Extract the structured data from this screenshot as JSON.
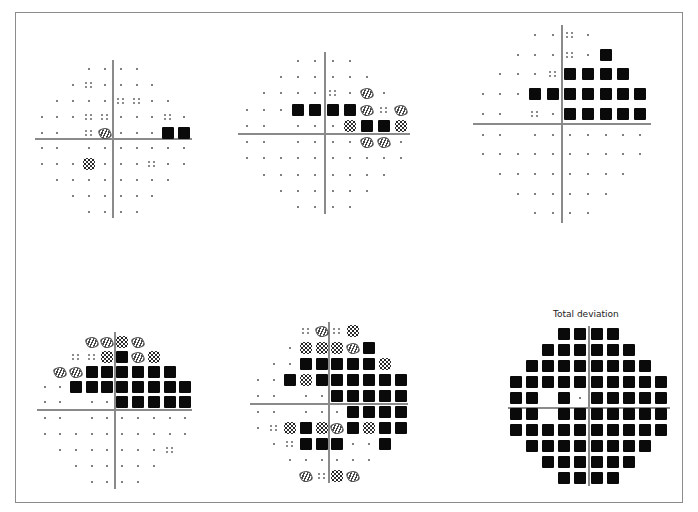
{
  "figure": {
    "legend_symbols": {
      ".": "normal point",
      ":": "p<5%",
      "/": "p<2%",
      "#": "p<1%",
      "B": "p<0.5%"
    }
  },
  "plots": [
    {
      "id": "plot-1",
      "title": "",
      "cols_x": [
        42,
        57,
        73,
        89,
        105,
        121,
        137,
        152,
        168,
        184
      ],
      "rows_y": [
        69,
        85,
        101,
        117,
        133,
        148,
        164,
        180,
        196,
        212
      ],
      "axis": {
        "x": 113,
        "y": 139,
        "h_from": 35,
        "h_to": 192,
        "v_from": 60,
        "v_to": 218
      },
      "rows": [
        "   ....   ",
        "  .:....  ",
        " ....::.. ",
        "...::...:.",
        ".. :/...BB",
        ".. .......",
        "...#...:..",
        " ........ ",
        "  ......  ",
        "   ....   "
      ]
    },
    {
      "id": "plot-2",
      "title": "",
      "cols_x": [
        247,
        264,
        281,
        298,
        315,
        333,
        350,
        367,
        384,
        401
      ],
      "rows_y": [
        61,
        77,
        93,
        110,
        126,
        142,
        158,
        175,
        191,
        207
      ],
      "axis": {
        "x": 325,
        "y": 134,
        "h_from": 238,
        "h_to": 410,
        "v_from": 52,
        "v_to": 214
      },
      "rows": [
        "   ....   ",
        "  ......  ",
        " ....:./. ",
        "...BBBB/:/",
        ".. ...#BB#",
        ".. ....//.",
        "..........",
        " ........ ",
        "  ......  ",
        "   ....   "
      ]
    },
    {
      "id": "plot-3",
      "title": "",
      "cols_x": [
        483,
        500,
        518,
        535,
        553,
        570,
        588,
        606,
        623,
        640
      ],
      "rows_y": [
        35,
        55,
        74,
        94,
        114,
        135,
        154,
        174,
        194,
        213
      ],
      "axis": {
        "x": 562,
        "y": 124,
        "h_from": 473,
        "h_to": 651,
        "v_from": 25,
        "v_to": 223
      },
      "rows": [
        "   ..:.   ",
        "  ...:.B  ",
        " ...:BBBB ",
        "...BBBBBBB",
        ".. :.BBBBB",
        ".. .......",
        "..........",
        " ........ ",
        "  ......  ",
        "   ....   "
      ]
    },
    {
      "id": "plot-4",
      "title": "",
      "cols_x": [
        45,
        60,
        76,
        92,
        107,
        122,
        138,
        154,
        170,
        185
      ],
      "rows_y": [
        342,
        357,
        372,
        387,
        402,
        418,
        434,
        450,
        466,
        482
      ],
      "axis": {
        "x": 115,
        "y": 410,
        "h_from": 37,
        "h_to": 192,
        "v_from": 332,
        "v_to": 489
      },
      "rows": [
        "   //#/   ",
        "  ::#B/#  ",
        " //BBBBBB ",
        "..BBBBBBBB",
        ".. ..BBBBB",
        ".. .......",
        "..........",
        " .......: ",
        "  ......  ",
        "   ....   "
      ]
    },
    {
      "id": "plot-5",
      "title": "",
      "cols_x": [
        258,
        274,
        290,
        306,
        322,
        337,
        353,
        369,
        385,
        401
      ],
      "rows_y": [
        331,
        348,
        364,
        380,
        396,
        412,
        428,
        444,
        460,
        476
      ],
      "axis": {
        "x": 329,
        "y": 404,
        "h_from": 250,
        "h_to": 408,
        "v_from": 322,
        "v_to": 483
      },
      "rows": [
        "   :/:#   ",
        "  .###/B  ",
        " ..BBBBB# ",
        "..B#BBBBBB",
        ".. ..BBBBB",
        ".. ...BBBB",
        ".:#B#/B#BB",
        " .:BBB..B ",
        "  ......  ",
        "   /:#/   "
      ]
    },
    {
      "id": "plot-6",
      "title": "Total deviation",
      "cols_x": [
        516,
        532,
        548,
        564,
        580,
        597,
        613,
        629,
        645,
        661
      ],
      "rows_y": [
        334,
        350,
        366,
        382,
        398,
        414,
        430,
        446,
        462,
        478
      ],
      "axis": {
        "x": 589,
        "y": 408,
        "h_from": 508,
        "h_to": 670,
        "v_from": 326,
        "v_to": 486
      },
      "rows": [
        "   BBBB   ",
        "  BBBBBB  ",
        " BBBBBBBB ",
        "BBBBBBBBBB",
        "BB B.BBBBB",
        "BB BBBBBBB",
        "BBBBBBBBBB",
        " BBBBBBBB ",
        "  BBBBBB  ",
        "   BBBB   "
      ]
    }
  ],
  "labels": {
    "plot6_title": "Total deviation"
  }
}
